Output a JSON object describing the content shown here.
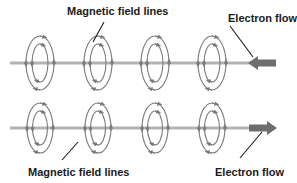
{
  "figure": {
    "background_color": "#ffffff",
    "wire_color": "#b3b3b3",
    "coil_color": "#7a7a7a",
    "arrow_color": "#6e6e6e",
    "leader_color": "#1a1a1a",
    "text_color": "#1a1a1a"
  },
  "labels": {
    "top_field_lines": "Magnetic field lines",
    "top_electron_flow": "Electron flow",
    "bottom_field_lines": "Magnetic field lines",
    "bottom_electron_flow": "Electron flow"
  },
  "diagram_data": {
    "type": "physics-schematic",
    "rows": [
      {
        "name": "top-row",
        "wire_y": 63,
        "wire_x_start": 10,
        "wire_x_end": 268,
        "electron_flow_direction": "left",
        "arrow_tip_x": 248,
        "arrow_tail_x": 276,
        "coil_centers_x": [
          40,
          98,
          155,
          212
        ],
        "coil_outer_rx": 14,
        "coil_outer_ry": 27,
        "coil_inner_rx": 8,
        "coil_inner_ry": 19,
        "field_direction": "clockwise"
      },
      {
        "name": "bottom-row",
        "wire_y": 128,
        "wire_x_start": 10,
        "wire_x_end": 268,
        "electron_flow_direction": "right",
        "arrow_tip_x": 277,
        "arrow_tail_x": 249,
        "coil_centers_x": [
          40,
          98,
          155,
          212
        ],
        "coil_outer_rx": 13,
        "coil_outer_ry": 25,
        "coil_inner_rx": 7.5,
        "coil_inner_ry": 17,
        "field_direction": "clockwise"
      }
    ],
    "leader_lines": [
      {
        "name": "top-field-leader",
        "x1": 104,
        "y1": 22,
        "x2": 93,
        "y2": 42
      },
      {
        "name": "top-electron-leader",
        "x1": 230,
        "y1": 26,
        "x2": 253,
        "y2": 57
      },
      {
        "name": "bottom-field-leader",
        "x1": 62,
        "y1": 160,
        "x2": 78,
        "y2": 142
      },
      {
        "name": "bottom-electron-leader",
        "x1": 240,
        "y1": 158,
        "x2": 262,
        "y2": 132
      }
    ]
  }
}
